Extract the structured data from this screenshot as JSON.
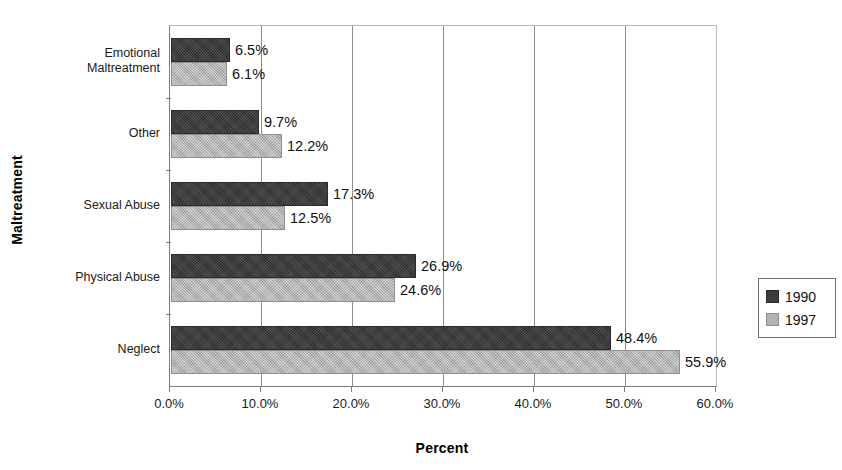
{
  "chart_data": {
    "type": "bar",
    "orientation": "horizontal",
    "title": "",
    "xlabel": "Percent",
    "ylabel": "Maltreatment",
    "xlim": [
      0,
      60
    ],
    "grid": true,
    "legend_position": "right",
    "categories": [
      "Emotional Maltreatment",
      "Other",
      "Sexual Abuse",
      "Physical Abuse",
      "Neglect"
    ],
    "category_label_lines": [
      [
        "Emotional",
        "Maltreatment"
      ],
      [
        "Other"
      ],
      [
        "Sexual Abuse"
      ],
      [
        "Physical Abuse"
      ],
      [
        "Neglect"
      ]
    ],
    "series": [
      {
        "name": "1990",
        "color": "#3c3c3c",
        "values": [
          6.5,
          9.7,
          17.3,
          26.9,
          48.4
        ],
        "labels": [
          "6.5%",
          "9.7%",
          "17.3%",
          "26.9%",
          "48.4%"
        ]
      },
      {
        "name": "1997",
        "color": "#b2b2b2",
        "values": [
          6.1,
          12.2,
          12.5,
          24.6,
          55.9
        ],
        "labels": [
          "6.1%",
          "12.2%",
          "12.5%",
          "24.6%",
          "55.9%"
        ]
      }
    ],
    "xticks": [
      0,
      10,
      20,
      30,
      40,
      50,
      60
    ],
    "xtick_labels": [
      "0.0%",
      "10.0%",
      "20.0%",
      "30.0%",
      "40.0%",
      "50.0%",
      "60.0%"
    ]
  },
  "legend": {
    "entries": [
      {
        "label": "1990",
        "swatch": "dark-swatch-icon"
      },
      {
        "label": "1997",
        "swatch": "light-swatch-icon"
      }
    ]
  }
}
